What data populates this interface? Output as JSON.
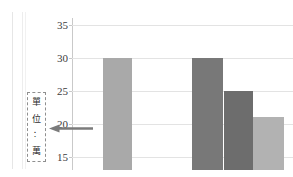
{
  "chart_data": {
    "type": "bar",
    "title": "",
    "xlabel": "",
    "ylabel": "",
    "categories": [
      "1",
      "2",
      "3",
      "4"
    ],
    "values": [
      30,
      30,
      25,
      21
    ],
    "ytick_labels": [
      "35",
      "30",
      "25",
      "20",
      "15"
    ],
    "ytick_values": [
      35,
      30,
      25,
      20,
      15
    ],
    "ylim": [
      13,
      36
    ],
    "grid": true,
    "legend": "none",
    "bar_colors": [
      "#a9a9a9",
      "#787878",
      "#6d6d6d",
      "#b2b2b2"
    ],
    "gridline_color": "#e3e3e3",
    "axis_color": "#c9c9c9"
  },
  "annotation": {
    "name": "unit-callout",
    "characters": [
      "單",
      "位",
      "：",
      "萬"
    ],
    "text": "單位：萬",
    "arrow_icon": "arrow-left-icon",
    "arrow_color": "#7b7b7b",
    "box_border_color": "#8f8f8f"
  },
  "artifacts": {
    "page_edge_label": "scan-edge-line"
  }
}
